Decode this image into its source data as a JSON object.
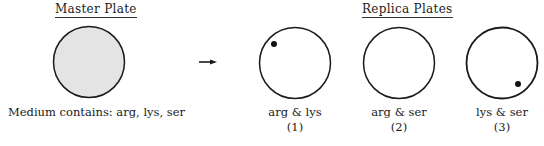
{
  "master": {
    "title": "Master Plate",
    "medium_label": "Medium contains:  arg, lys, ser",
    "fill_color": "#e4e4e4"
  },
  "replica": {
    "title": "Replica Plates",
    "plates": [
      {
        "label": "arg & lys",
        "number": "(1)",
        "colony": "top-left"
      },
      {
        "label": "arg & ser",
        "number": "(2)",
        "colony": "none"
      },
      {
        "label": "lys & ser",
        "number": "(3)",
        "colony": "bottom-right"
      }
    ]
  },
  "arrow": {
    "icon": "arrow-right-icon"
  },
  "colors": {
    "stroke": "#1a1a1a",
    "background": "#ffffff"
  }
}
